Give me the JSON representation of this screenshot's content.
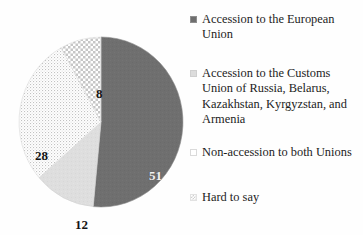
{
  "chart_data": {
    "type": "pie",
    "title": "",
    "subtitle": "",
    "xlabel": "",
    "ylabel": "",
    "grid": false,
    "legend_position": "right",
    "value_suffix": "",
    "start_angle_deg": 0,
    "direction": "clockwise",
    "categories": [
      "Accession to the European Union",
      "Accession to the Customs Union of Russia, Belarus, Kazakhstan, Kyrgyzstan, and Armenia",
      "Non-accession to both Unions",
      "Hard to say"
    ],
    "values": [
      51,
      12,
      28,
      8
    ],
    "data_labels": [
      "51",
      "12",
      "28",
      "8"
    ],
    "slice_styles": [
      "solid-dark-gray",
      "solid-light-gray",
      "white-dotted",
      "white-checkered"
    ],
    "colors": [
      "#6e6e6e",
      "#dcdcdc",
      "#fbfbfb",
      "#fdfdfd"
    ]
  },
  "pie": {
    "slices": [
      {
        "label": "51",
        "value": 51,
        "category": "Accession to the European Union",
        "fill": "url(#fill-solid-dark)",
        "stroke": "#8d8d8d",
        "path": "M 83 86 L 83 2 A 84 86 0 1 1 58.5 168.5 Z"
      },
      {
        "label": "12",
        "value": 12,
        "category": "Accession to the Customs Union of Russia, Belarus, Kazakhstan, Kyrgyzstan, and Armenia",
        "fill": "url(#fill-solid-light)",
        "stroke": "#d2d2d2",
        "path": "M 83 86 L 58.5 168.5 A 84 86 0 0 1 5.1 105.5 Z"
      },
      {
        "label": "28",
        "value": 28,
        "category": "Non-accession to both Unions",
        "fill": "url(#fill-dots)",
        "stroke": "#dcdcdc",
        "path": "M 83 86 L 5.1 105.5 A 84 86 0 0 1 43.4 11.2 Z"
      },
      {
        "label": "8",
        "value": 8,
        "category": "Hard to say",
        "fill": "url(#fill-check)",
        "stroke": "#e0e0e0",
        "path": "M 83 86 L 43.4 11.2 A 84 86 0 0 1 83 2 Z"
      }
    ]
  },
  "legend": {
    "entries": [
      {
        "label": "Accession to the European\nUnion",
        "swatch": "solid-dark-gray"
      },
      {
        "label": "Accession to the Customs Union of Russia, Belarus, Kazakhstan, Kyrgyzstan, and Armenia",
        "swatch": "solid-light-gray"
      },
      {
        "label": "Non-accession to both Unions",
        "swatch": "white-dotted"
      },
      {
        "label": "Hard to say",
        "swatch": "white-checkered"
      }
    ]
  }
}
